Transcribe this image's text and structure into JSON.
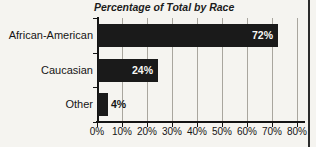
{
  "page": {
    "background": "#f5f4f0",
    "border_right_color": "#2b2b2b"
  },
  "chart_data": {
    "type": "bar",
    "orientation": "horizontal",
    "title": "Percentage of Total by Race",
    "categories": [
      "African-American",
      "Caucasian",
      "Other"
    ],
    "values": [
      72,
      24,
      4
    ],
    "value_labels": [
      "72%",
      "24%",
      "4%"
    ],
    "xlabel": "",
    "ylabel": "",
    "xlim": [
      0,
      80
    ],
    "xticks": [
      0,
      10,
      20,
      30,
      40,
      50,
      60,
      70,
      80
    ],
    "xtick_labels": [
      "0%",
      "10%",
      "20%",
      "30%",
      "40%",
      "50%",
      "60%",
      "70%",
      "80%"
    ],
    "grid": true,
    "legend": null,
    "bar_color": "#1a1a1a",
    "grid_color": "#a9a69e",
    "axis_color": "#141414",
    "value_label_inside_color": "#f7f6f3",
    "value_label_outside_color": "#141414"
  }
}
